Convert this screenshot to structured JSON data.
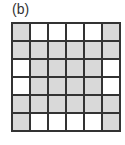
{
  "label": "(b)",
  "grid": {
    "rows": 6,
    "cols": 6,
    "colors": {
      "shaded": "#d9d9d9",
      "empty": "#ffffff",
      "line": "#333333"
    },
    "cells": [
      [
        1,
        0,
        0,
        0,
        0,
        1
      ],
      [
        1,
        1,
        1,
        1,
        1,
        1
      ],
      [
        0,
        1,
        1,
        1,
        1,
        0
      ],
      [
        0,
        1,
        1,
        1,
        1,
        0
      ],
      [
        1,
        1,
        1,
        1,
        1,
        1
      ],
      [
        1,
        0,
        0,
        0,
        0,
        1
      ]
    ]
  }
}
